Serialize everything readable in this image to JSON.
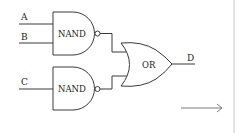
{
  "diagram": {
    "type": "logic-circuit",
    "inputs": [
      {
        "id": "A",
        "label": "A"
      },
      {
        "id": "B",
        "label": "B"
      },
      {
        "id": "C",
        "label": "C"
      }
    ],
    "gates": [
      {
        "id": "nand1",
        "label": "NAND",
        "inputs": [
          "A",
          "B"
        ]
      },
      {
        "id": "nand2",
        "label": "NAND",
        "inputs": [
          "C"
        ]
      },
      {
        "id": "or1",
        "label": "OR",
        "inputs": [
          "nand1",
          "nand2"
        ]
      }
    ],
    "output": {
      "id": "D",
      "label": "D",
      "source": "or1"
    },
    "arrow": {
      "direction": "right"
    }
  },
  "colors": {
    "line": "#3a3a3a",
    "text": "#222222",
    "arrow": "#7a7a7a",
    "background": "#ffffff"
  }
}
